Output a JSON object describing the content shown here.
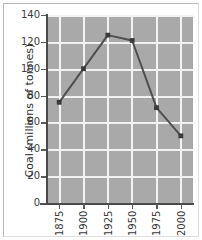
{
  "chart_data": {
    "type": "line",
    "title": "",
    "xlabel": "",
    "ylabel": "Coal (millions of tonnes)",
    "x": [
      1875,
      1900,
      1925,
      1950,
      1975,
      2000
    ],
    "xtick_labels": [
      "1875",
      "1900",
      "1925",
      "1950",
      "1975",
      "2000"
    ],
    "values": [
      75,
      100,
      125,
      121,
      71,
      50
    ],
    "series": [
      {
        "name": "Coal production",
        "values": [
          75,
          100,
          125,
          121,
          71,
          50
        ]
      }
    ],
    "ylim": [
      0,
      140
    ],
    "xlim": [
      1862.5,
      2012.5
    ],
    "ytick_labels": [
      "0",
      "20",
      "40",
      "60",
      "80",
      "100",
      "120",
      "140"
    ],
    "yticks": [
      0,
      20,
      40,
      60,
      80,
      100,
      120,
      140
    ],
    "grid": true,
    "legend": "none",
    "colors": {
      "plot_background": "#a9a9a9",
      "gridline": "#f2f2f2",
      "line": "#4f4f4f",
      "marker": "#3a3a3a",
      "axis": "#4a4a4a",
      "text": "#3b3b3b",
      "page_background": "#ffffff"
    }
  }
}
